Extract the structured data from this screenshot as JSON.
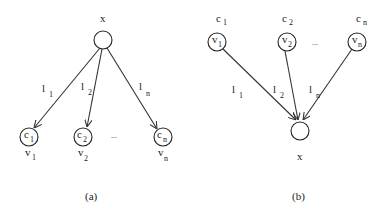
{
  "panels": [
    {
      "id": "a",
      "caption": "(a)",
      "root": {
        "label": "x"
      },
      "children": [
        {
          "inner": "c",
          "inner_sub": "1",
          "below": "v",
          "below_sub": "1",
          "edge": "l",
          "edge_sub": "1"
        },
        {
          "inner": "c",
          "inner_sub": "2",
          "below": "v",
          "below_sub": "2",
          "edge": "l",
          "edge_sub": "2"
        },
        {
          "inner": "c",
          "inner_sub": "n",
          "below": "v",
          "below_sub": "n",
          "edge": "l",
          "edge_sub": "n"
        }
      ],
      "ellipsis": "..."
    },
    {
      "id": "b",
      "caption": "(b)",
      "root": {
        "label": "x"
      },
      "children": [
        {
          "inner": "v",
          "inner_sub": "1",
          "above": "c",
          "above_sub": "1",
          "edge": "l",
          "edge_sub": "1"
        },
        {
          "inner": "v",
          "inner_sub": "2",
          "above": "c",
          "above_sub": "2",
          "edge": "l",
          "edge_sub": "2"
        },
        {
          "inner": "v",
          "inner_sub": "n",
          "above": "c",
          "above_sub": "n",
          "edge": "l",
          "edge_sub": "n"
        }
      ],
      "ellipsis": "..."
    }
  ],
  "colors": {
    "stroke": "#222222",
    "background": "#ffffff"
  }
}
